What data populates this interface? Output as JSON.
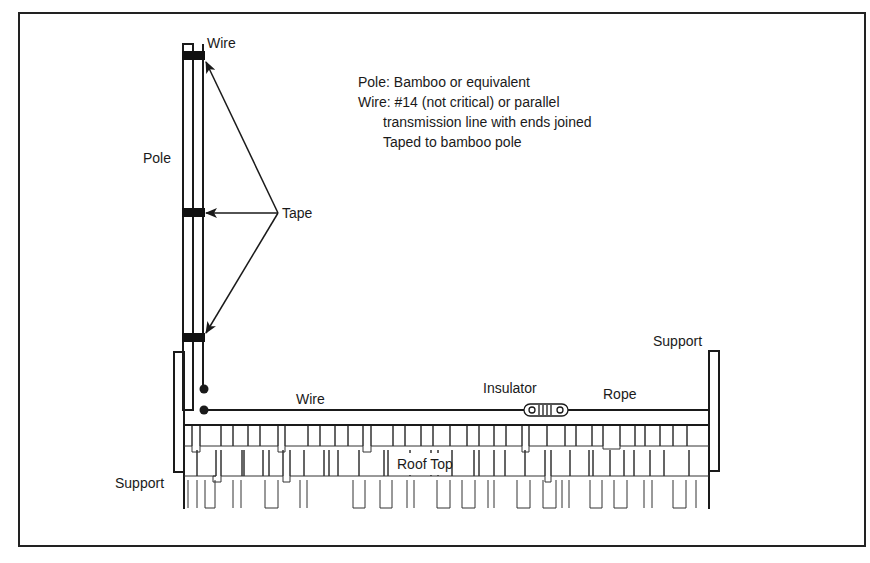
{
  "diagram": {
    "labels": {
      "wire_top": "Wire",
      "pole": "Pole",
      "tape": "Tape",
      "wire_horizontal": "Wire",
      "insulator": "Insulator",
      "rope": "Rope",
      "support_right": "Support",
      "support_left": "Support",
      "roof_top": "Roof Top"
    },
    "notes": [
      {
        "text": "Pole: Bamboo or equivalent",
        "indent": false
      },
      {
        "text": "Wire: #14 (not critical) or parallel",
        "indent": false
      },
      {
        "text": "transmission line with ends joined",
        "indent": true
      },
      {
        "text": "Taped to bamboo pole",
        "indent": true
      }
    ],
    "colors": {
      "line": "#1a1a1a",
      "tape": "#111111",
      "background": "#ffffff"
    }
  }
}
